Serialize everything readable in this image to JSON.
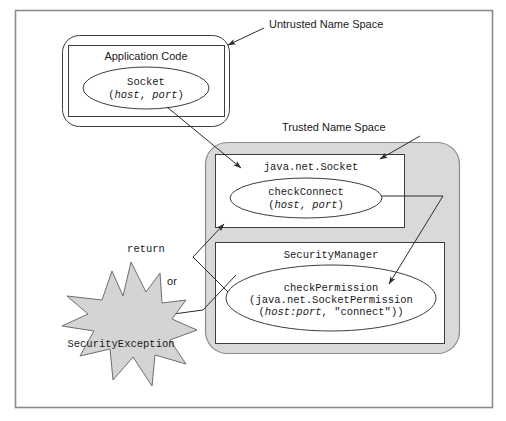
{
  "figure": {
    "colors": {
      "outer_frame_border": "#8c8c8c",
      "box_border": "#3d3d3d",
      "trusted_fill": "#d9d9d9",
      "trusted_border": "#8c8c8c",
      "starburst_fill": "#d4d4d4",
      "starburst_border": "#6e6e6e",
      "line": "#3d3d3d",
      "text": "#1a1a1a",
      "background": "#ffffff"
    }
  },
  "annotations": {
    "untrusted_name_space": "Untrusted Name Space",
    "trusted_name_space": "Trusted Name Space",
    "return_label": "return",
    "or_label": "or"
  },
  "untrusted": {
    "app_box_title": "Application Code",
    "socket_call": {
      "name": "Socket",
      "args_open": "(",
      "arg1": "host",
      "arg_sep": ", ",
      "arg2": "port",
      "args_close": ")"
    }
  },
  "trusted": {
    "socket_class": {
      "title": "java.net.Socket",
      "method": {
        "name": "checkConnect",
        "args_open": "(",
        "arg1": "host",
        "arg_sep": ", ",
        "arg2": "port",
        "args_close": ")"
      }
    },
    "security_manager": {
      "title": "SecurityManager",
      "method": {
        "name": "checkPermission",
        "line2_open": "(java.net.SocketPermission",
        "line3_open": "(",
        "line3_arg1": "host:port",
        "line3_sep": ", ",
        "line3_arg2": "\"connect\"",
        "line3_close": "))"
      }
    }
  },
  "exception": {
    "label": "SecurityException"
  }
}
